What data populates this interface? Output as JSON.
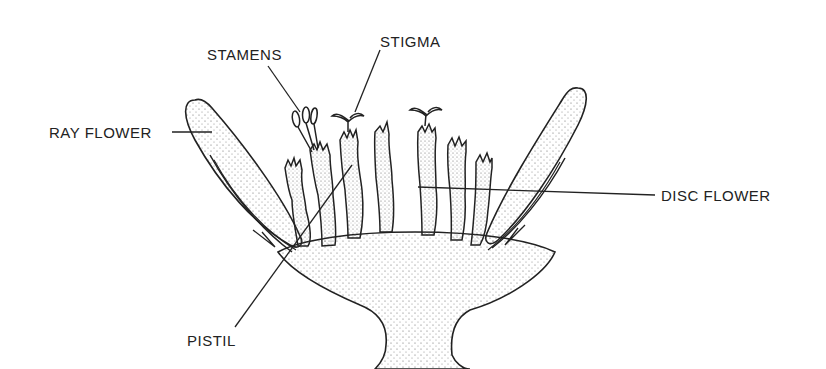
{
  "diagram": {
    "colors": {
      "ink": "#222222",
      "background": "#ffffff",
      "stipple": "#555555"
    },
    "labels": {
      "stamens": "STAMENS",
      "stigma": "STIGMA",
      "ray_flower": "RAY FLOWER",
      "disc_flower": "DISC FLOWER",
      "pistil": "PISTIL"
    }
  }
}
